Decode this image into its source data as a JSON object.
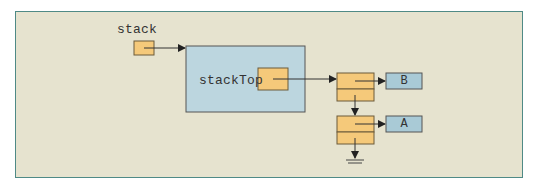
{
  "diagram": {
    "variables": {
      "stack_label": "stack",
      "stackTop_label": "stackTop"
    },
    "nodes": [
      {
        "id": "node-top",
        "value": "B",
        "next": "node-bottom"
      },
      {
        "id": "node-bottom",
        "value": "A",
        "next": null
      }
    ],
    "colors": {
      "background": "#e6e3cf",
      "frame_border": "#4f8a86",
      "pointer_cell": "#f5c97a",
      "object_box": "#bcd6df",
      "value_box": "#a9cad6",
      "stroke": "#5a5040",
      "arrow": "#222222"
    },
    "null_terminator": "ground-symbol"
  }
}
